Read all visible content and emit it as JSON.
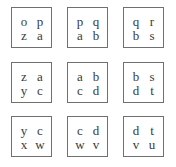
{
  "puzzle": {
    "rows": 3,
    "cols": 3,
    "tiles": [
      {
        "cells": [
          "o",
          "p",
          "z",
          "a"
        ]
      },
      {
        "cells": [
          "p",
          "q",
          "a",
          "b"
        ]
      },
      {
        "cells": [
          "q",
          "r",
          "b",
          "s"
        ]
      },
      {
        "cells": [
          "z",
          "a",
          "y",
          "c"
        ]
      },
      {
        "cells": [
          "a",
          "b",
          "c",
          "d"
        ]
      },
      {
        "cells": [
          "b",
          "s",
          "d",
          "t"
        ]
      },
      {
        "cells": [
          "y",
          "c",
          "x",
          "w"
        ]
      },
      {
        "cells": [
          "c",
          "d",
          "w",
          "v"
        ]
      },
      {
        "cells": [
          "d",
          "t",
          "v",
          "u"
        ]
      }
    ]
  },
  "colors": {
    "border": "#707070",
    "text": "#3a3a3a",
    "background": "#ffffff"
  }
}
